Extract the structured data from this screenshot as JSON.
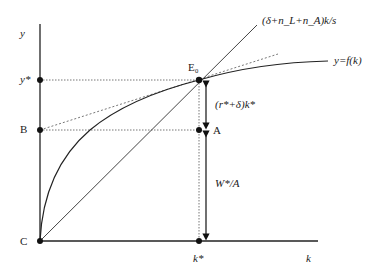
{
  "diagram": {
    "type": "solow-growth-steady-state",
    "axes": {
      "y_label": "y",
      "x_label": "k",
      "origin_label": "C"
    },
    "curves": {
      "production": "y=f(k)",
      "ray": "(δ+n_L+n_A)k/s"
    },
    "points": {
      "equilibrium": "E₀",
      "A": "A",
      "B": "B",
      "y_star": "y*",
      "k_star": "k*"
    },
    "annotations": {
      "upper_segment": "(r*+δ)k*",
      "lower_segment": "W*/A"
    }
  },
  "colors": {
    "line": "#222222",
    "dotted": "#666666",
    "background": "#ffffff"
  }
}
